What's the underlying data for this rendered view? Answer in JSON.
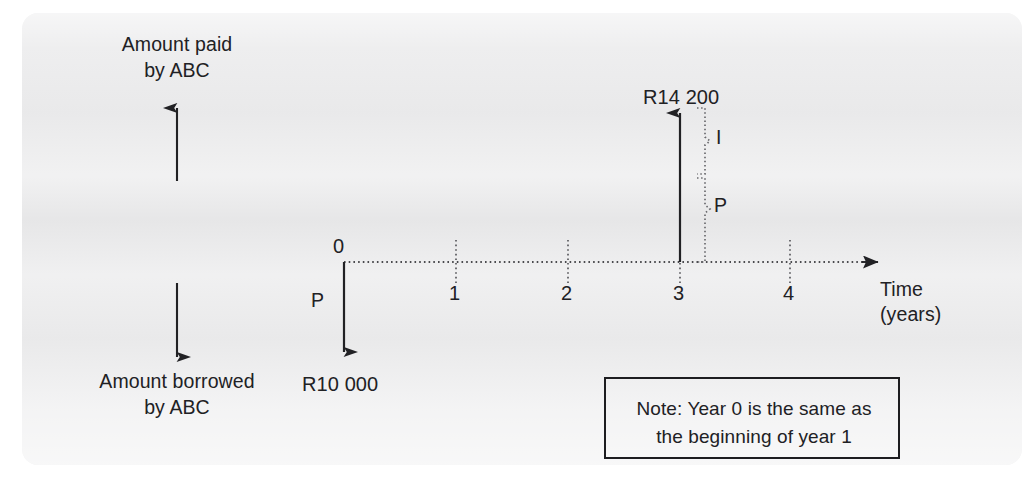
{
  "diagram": {
    "type": "cash-flow-timeline",
    "axis": {
      "label_line1": "Time",
      "label_line2": "(years)",
      "tick_labels": [
        "0",
        "1",
        "2",
        "3",
        "4"
      ],
      "tick_values": [
        0,
        1,
        2,
        3,
        4
      ],
      "start_label": "0",
      "style": "dotted"
    },
    "up_axis_label": "Amount paid\nby ABC",
    "down_axis_label": "Amount borrowed\nby ABC",
    "cash_flows": [
      {
        "id": "borrowed",
        "time": 0,
        "direction": "down",
        "amount_label": "R10 000",
        "symbol_label": "P",
        "meaning": "Amount borrowed by ABC at year 0"
      },
      {
        "id": "repaid",
        "time": 3,
        "direction": "up",
        "amount_label": "R14 200",
        "brace_upper_label": "I",
        "brace_lower_label": "P",
        "meaning": "Amount paid by ABC at year 3, split into principal P and interest I"
      }
    ],
    "note": {
      "text": "Note: Year 0 is the same as\nthe beginning of year 1",
      "line1": "Note: Year 0 is the same as",
      "line2": "the beginning of year 1"
    },
    "colors": {
      "ink": "#212124",
      "page": "#ececed",
      "background": "#ffffff",
      "note_border": "#1d1d20"
    }
  }
}
